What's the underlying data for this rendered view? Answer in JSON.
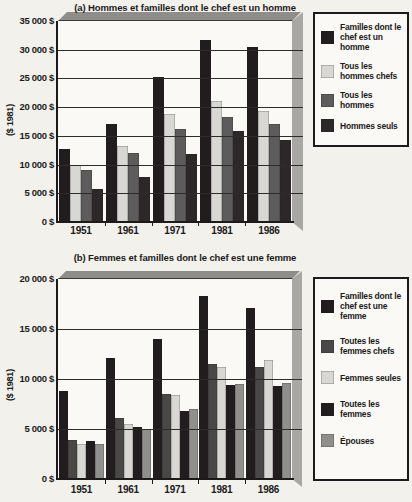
{
  "chart_data": [
    {
      "type": "bar",
      "title": "(a) Hommes et familles dont le chef est un homme",
      "ylabel": "($ 1981)",
      "categories": [
        "1951",
        "1961",
        "1971",
        "1981",
        "1986"
      ],
      "series": [
        {
          "name": "Familles dont le chef est un homme",
          "legend_label": "Familles dont le\nchef est un\nhomme",
          "color": "#211d1e",
          "values": [
            12700,
            17100,
            25300,
            31700,
            30500
          ]
        },
        {
          "name": "Tous les hommes chefs",
          "legend_label": "Tous les\nhommes chefs",
          "color": "#d8d7d4",
          "values": [
            10000,
            13300,
            18800,
            21000,
            19400
          ]
        },
        {
          "name": "Tous les hommes",
          "legend_label": "Tous les\nhommes",
          "color": "#5d5b5b",
          "values": [
            9000,
            12100,
            16200,
            18200,
            17000
          ]
        },
        {
          "name": "Hommes seuls",
          "legend_label": "Hommes seuls",
          "color": "#2c2728",
          "values": [
            5800,
            7800,
            11900,
            15900,
            14200
          ]
        }
      ],
      "ylim": [
        0,
        35000
      ],
      "ytick_step": 5000,
      "ytick_labels": [
        "35 000 $",
        "30 000 $",
        "25 000 $",
        "20 000 $",
        "15 000 $",
        "10 000 $",
        "5 000 $",
        "0 $"
      ],
      "grid": true,
      "legend_position": "right"
    },
    {
      "type": "bar",
      "title": "(b) Femmes et familles dont le chef est une femme",
      "ylabel": "($ 1981)",
      "categories": [
        "1951",
        "1961",
        "1971",
        "1981",
        "1986"
      ],
      "series": [
        {
          "name": "Familles dont le chef est une femme",
          "legend_label": "Familles dont le\nchef est une\nfemme",
          "color": "#211d1e",
          "values": [
            8800,
            12100,
            14000,
            18300,
            17100
          ]
        },
        {
          "name": "Toutes les femmes chefs",
          "legend_label": "Toutes les\nfemmes chefs",
          "color": "#4a4747",
          "values": [
            3900,
            6100,
            8500,
            11500,
            11200
          ]
        },
        {
          "name": "Femmes seules",
          "legend_label": "Femmes seules",
          "color": "#d8d7d4",
          "values": [
            3500,
            5500,
            8400,
            11200,
            11900
          ]
        },
        {
          "name": "Toutes les femmes",
          "legend_label": "Toutes les\nfemmes",
          "color": "#211d1e",
          "values": [
            3800,
            5200,
            6800,
            9400,
            9300
          ]
        },
        {
          "name": "Épouses",
          "legend_label": "Épouses",
          "color": "#918f8e",
          "values": [
            3500,
            5000,
            7000,
            9500,
            9600
          ]
        }
      ],
      "ylim": [
        0,
        20000
      ],
      "ytick_step": 5000,
      "ytick_labels": [
        "20 000 $",
        "15 000 $",
        "10 000 $",
        "5 000 $",
        "0 $"
      ],
      "grid": true,
      "legend_position": "right"
    }
  ]
}
